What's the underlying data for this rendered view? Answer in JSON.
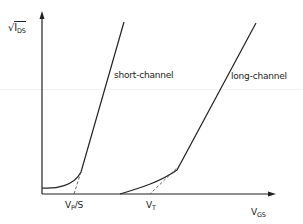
{
  "diagram": {
    "y_axis": {
      "symbol": "√",
      "var": "I",
      "sub": "DS"
    },
    "x_axis": {
      "var": "V",
      "sub": "GS"
    },
    "curves": [
      {
        "name": "short-channel",
        "label": "short-channel"
      },
      {
        "name": "long-channel",
        "label": "long-channel"
      }
    ],
    "ticks": [
      {
        "var": "V",
        "sub": "P",
        "suffix": "/S"
      },
      {
        "var": "V",
        "sub": "T",
        "suffix": ""
      }
    ],
    "colors": {
      "line": "#222222",
      "background": "#ffffff"
    }
  }
}
